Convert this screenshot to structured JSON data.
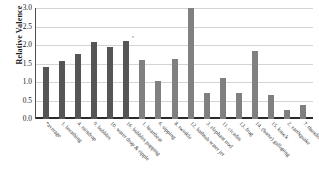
{
  "chart_data": {
    "type": "bar",
    "title": "",
    "xlabel": "",
    "ylabel": "Relative Valence",
    "ylim": [
      0.0,
      3.0
    ],
    "ytick_step": 0.5,
    "yticks": [
      "3.0",
      "2.5",
      "2.0",
      "1.5",
      "1.0",
      "0.5",
      "0.0"
    ],
    "ytick_values": [
      3.0,
      2.5,
      2.0,
      1.5,
      1.0,
      0.5,
      0.0
    ],
    "grid": true,
    "legend": false,
    "legend_position": "none",
    "categories": [
      "*average",
      "1. breathing",
      "4. raindrop",
      "9. bubbles",
      "10. water drop & ripple",
      "16. bubbles popping",
      "1. heartbeat",
      "6. sipping",
      "8. twinkle",
      "12. bathtub water jet",
      "3. elephant trod",
      "11. cicadas",
      "13. frog",
      "14. (horse) galloping",
      "15. knock",
      "2. earthquake",
      "7. thunder"
    ],
    "values": [
      1.4,
      1.57,
      1.76,
      2.09,
      1.94,
      2.12,
      1.59,
      1.04,
      1.61,
      2.99,
      0.69,
      1.1,
      0.71,
      1.85,
      0.66,
      0.25,
      0.37
    ],
    "bar_colors": [
      "#555555",
      "#555555",
      "#555555",
      "#555555",
      "#555555",
      "#555555",
      "#808080",
      "#808080",
      "#808080",
      "#808080",
      "#808080",
      "#808080",
      "#808080",
      "#808080",
      "#808080",
      "#808080",
      "#808080"
    ],
    "colors": {
      "bar_dark": "#555555",
      "bar_light": "#808080",
      "gridline": "#d4d4d4",
      "axis": "#2b2b2b",
      "text": "#1a1a1a",
      "background": "#ffffff"
    }
  }
}
